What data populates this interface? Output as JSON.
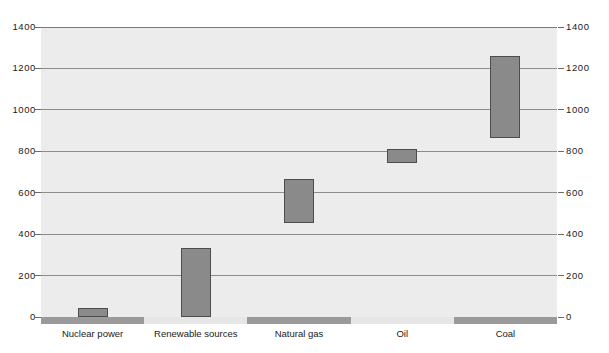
{
  "chart_data": {
    "type": "bar",
    "title": "",
    "xlabel": "",
    "ylabel": "",
    "ylim": [
      0,
      1400
    ],
    "yticks": [
      0,
      200,
      400,
      600,
      800,
      1000,
      1200,
      1400
    ],
    "ytick_labels": [
      "0",
      "200",
      "400",
      "600",
      "800",
      "1000",
      "1200",
      "1400"
    ],
    "grid": true,
    "legend": "none",
    "dual_axis": true,
    "bar_style": "floating-range",
    "categories": [
      "Nuclear power",
      "Renewable sources",
      "Natural gas",
      "Oil",
      "Coal"
    ],
    "series": [
      {
        "name": "range-low",
        "values": [
          0,
          0,
          455,
          745,
          865
        ]
      },
      {
        "name": "range-high",
        "values": [
          45,
          333,
          665,
          810,
          1262
        ]
      }
    ],
    "ranges": [
      {
        "category": "Nuclear power",
        "low": 0,
        "high": 45
      },
      {
        "category": "Renewable sources",
        "low": 0,
        "high": 333
      },
      {
        "category": "Natural gas",
        "low": 455,
        "high": 665
      },
      {
        "category": "Oil",
        "low": 745,
        "high": 810
      },
      {
        "category": "Coal",
        "low": 865,
        "high": 1262
      }
    ],
    "axis_band_pattern": [
      "dark",
      "light",
      "dark",
      "light",
      "dark"
    ],
    "colors": {
      "bar_fill": "#8a8a8a",
      "bar_stroke": "#4d4d4d",
      "plot_background": "#ececec",
      "gridline": "#8c8c8c",
      "axis_band_dark": "#9a9a9a",
      "axis_band_light": "#e6e6e6",
      "text": "#1a1a1a",
      "page_background": "#ffffff"
    }
  }
}
